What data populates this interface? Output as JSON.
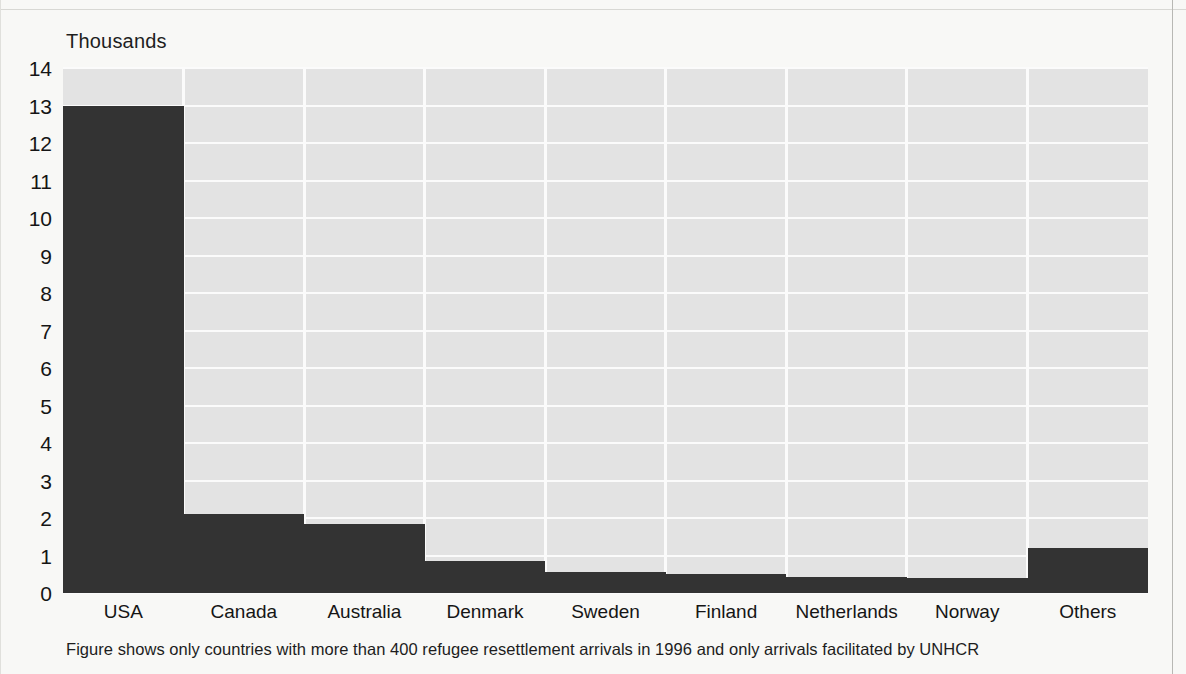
{
  "figure": {
    "unit_label": "Thousands",
    "footnote": "Figure shows only countries with more than 400 refugee resettlement arrivals in 1996 and only arrivals facilitated by UNHCR"
  },
  "chart_data": {
    "type": "bar",
    "title": "",
    "subtitle": "",
    "xlabel": "",
    "ylabel": "Thousands",
    "ylim": [
      0,
      14
    ],
    "yticks": [
      0,
      1,
      2,
      3,
      4,
      5,
      6,
      7,
      8,
      9,
      10,
      11,
      12,
      13,
      14
    ],
    "ytick_labels": [
      "0",
      "1",
      "2",
      "3",
      "4",
      "5",
      "6",
      "7",
      "8",
      "9",
      "10",
      "11",
      "12",
      "13",
      "14"
    ],
    "grid": true,
    "legend": null,
    "categories": [
      "USA",
      "Canada",
      "Australia",
      "Denmark",
      "Sweden",
      "Finland",
      "Netherlands",
      "Norway",
      "Others"
    ],
    "values": [
      13.0,
      2.1,
      1.85,
      0.85,
      0.55,
      0.52,
      0.42,
      0.4,
      1.2
    ],
    "annotation": "Figure shows only countries with more than 400 refugee resettlement arrivals in 1996 and only arrivals facilitated by UNHCR",
    "colors": {
      "bar": "#333333",
      "plot_background": "#e3e3e3",
      "gridline": "#fbfbfb",
      "page_background": "#f8f8f6",
      "text": "#151515"
    }
  }
}
